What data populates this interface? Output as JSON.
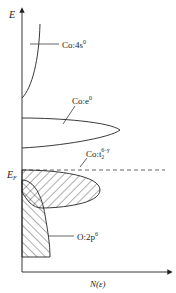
{
  "diagram": {
    "axes": {
      "y_label": "E",
      "x_label": "N(ε)",
      "fermi_label_main": "E",
      "fermi_label_sub": "F"
    },
    "bands": [
      {
        "id": "co-4s",
        "label_main": "Co:4s",
        "label_sup": "0"
      },
      {
        "id": "co-e",
        "label_main": "Co:e",
        "label_sup": "0"
      },
      {
        "id": "co-t2",
        "label_main": "Co:t",
        "label_sub": "2",
        "label_sup": "6−y"
      },
      {
        "id": "o-2p",
        "label_main": "O:2p",
        "label_sup": "6"
      }
    ],
    "colors": {
      "line": "#222222",
      "hatch": "#333333",
      "background": "#ffffff"
    }
  }
}
